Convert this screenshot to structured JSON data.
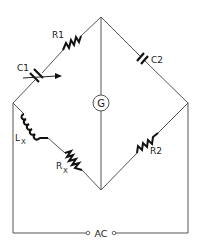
{
  "diagram": {
    "type": "AC bridge circuit",
    "nodes": [
      "top",
      "left",
      "right",
      "bottom"
    ],
    "components": [
      {
        "id": "R1",
        "label": "R1",
        "kind": "resistor",
        "branch": "left-top"
      },
      {
        "id": "C1",
        "label": "C1",
        "kind": "variable-capacitor",
        "branch": "left-top"
      },
      {
        "id": "C2",
        "label": "C2",
        "kind": "capacitor",
        "branch": "top-right"
      },
      {
        "id": "G",
        "label": "G",
        "kind": "galvanometer",
        "branch": "top-bottom"
      },
      {
        "id": "Lx",
        "label": "L",
        "sub": "X",
        "kind": "inductor",
        "branch": "left-bottom"
      },
      {
        "id": "Rx",
        "label": "R",
        "sub": "X",
        "kind": "resistor",
        "branch": "left-bottom"
      },
      {
        "id": "R2",
        "label": "R2",
        "kind": "resistor",
        "branch": "bottom-right"
      },
      {
        "id": "AC",
        "label": "AC",
        "kind": "ac-source",
        "branch": "left-right"
      }
    ]
  },
  "labels": {
    "r1": "R1",
    "c1": "C1",
    "c2": "C2",
    "g": "G",
    "lx_main": "L",
    "lx_sub": "X",
    "rx_main": "R",
    "rx_sub": "X",
    "r2": "R2",
    "ac": "AC"
  },
  "colors": {
    "wire": "#555555",
    "component": "#111111",
    "background": "#ffffff"
  }
}
